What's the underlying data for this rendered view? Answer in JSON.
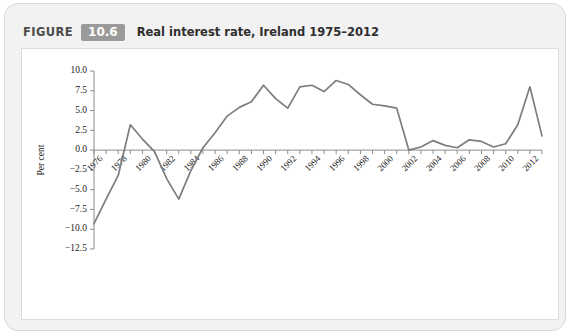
{
  "figure": {
    "label": "FIGURE",
    "number": "10.6",
    "title": "Real interest rate, Ireland 1975–2012",
    "badge_color": "#9a9a9a"
  },
  "chart_data": {
    "type": "line",
    "title": "Real interest rate, Ireland 1975–2012",
    "xlabel": "",
    "ylabel": "Per cent",
    "line_color": "#7d7d7d",
    "grid": false,
    "legend": false,
    "ylim": [
      -12.5,
      10.0
    ],
    "xlim": [
      1975,
      2012
    ],
    "ytick_labels": [
      "10.0",
      "7.5",
      "5.0",
      "2.5",
      "0.0",
      "−2.5",
      "−5.0",
      "−7.5",
      "−10.0",
      "−12.5"
    ],
    "ytick_values": [
      10.0,
      7.5,
      5.0,
      2.5,
      0.0,
      -2.5,
      -5.0,
      -7.5,
      -10.0,
      -12.5
    ],
    "xtick_labels": [
      "1976",
      "1978",
      "1980",
      "1982",
      "1984",
      "1986",
      "1988",
      "1990",
      "1992",
      "1994",
      "1996",
      "1998",
      "2000",
      "2002",
      "2004",
      "2006",
      "2008",
      "2010",
      "2012"
    ],
    "xtick_values": [
      1976,
      1978,
      1980,
      1982,
      1984,
      1986,
      1988,
      1990,
      1992,
      1994,
      1996,
      1998,
      2000,
      2002,
      2004,
      2006,
      2008,
      2010,
      2012
    ],
    "x": [
      1975,
      1976,
      1977,
      1978,
      1979,
      1980,
      1981,
      1982,
      1983,
      1984,
      1985,
      1986,
      1987,
      1988,
      1989,
      1990,
      1991,
      1992,
      1993,
      1994,
      1995,
      1996,
      1997,
      1998,
      1999,
      2000,
      2001,
      2002,
      2003,
      2004,
      2005,
      2006,
      2007,
      2008,
      2009,
      2010,
      2011,
      2012
    ],
    "values": [
      -9.3,
      -6.2,
      -3.2,
      3.2,
      1.4,
      -0.2,
      -3.6,
      -6.2,
      -2.6,
      0.3,
      2.2,
      4.3,
      5.4,
      6.1,
      8.2,
      6.5,
      5.3,
      8.0,
      8.2,
      7.4,
      8.8,
      8.3,
      7.0,
      5.8,
      5.6,
      5.3,
      0.0,
      0.4,
      1.2,
      0.6,
      0.3,
      1.3,
      1.1,
      0.4,
      0.8,
      3.2,
      8.0,
      1.8
    ]
  }
}
